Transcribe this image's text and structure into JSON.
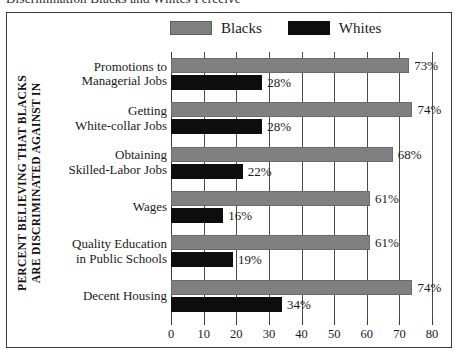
{
  "figure": {
    "top_caption": "Discrimination Blacks and Whites Perceive",
    "axis_title_line1": "PERCENT BELIEVING THAT BLACKS",
    "axis_title_line2": "ARE DISCRIMINATED AGAINST IN"
  },
  "legend": {
    "entries": [
      {
        "label": "Blacks",
        "color": "#808080",
        "swatch": "blacks"
      },
      {
        "label": "Whites",
        "color": "#0d0d0d",
        "swatch": "whites"
      }
    ]
  },
  "chart_data": {
    "type": "bar",
    "orientation": "horizontal",
    "grouped": true,
    "title": "Discrimination Blacks and Whites Perceive",
    "xlabel": "",
    "ylabel": "PERCENT BELIEVING THAT BLACKS ARE DISCRIMINATED AGAINST IN",
    "xlim": [
      0,
      80
    ],
    "xticks": [
      0,
      10,
      20,
      30,
      40,
      50,
      60,
      70,
      80
    ],
    "xticklabels": [
      "0",
      "10",
      "20",
      "30",
      "40",
      "50",
      "60",
      "70",
      "80"
    ],
    "grid": "vertical",
    "legend_position": "top-center",
    "categories": [
      "Promotions to Managerial Jobs",
      "Getting White-collar Jobs",
      "Obtaining Skilled-Labor Jobs",
      "Wages",
      "Quality Education in Public Schools",
      "Decent Housing"
    ],
    "category_lines": [
      [
        "Promotions to",
        "Managerial Jobs"
      ],
      [
        "Getting",
        "White-collar Jobs"
      ],
      [
        "Obtaining",
        "Skilled-Labor Jobs"
      ],
      [
        "Wages"
      ],
      [
        "Quality Education",
        "in Public Schools"
      ],
      [
        "Decent Housing"
      ]
    ],
    "series": [
      {
        "name": "Blacks",
        "color": "#808080",
        "values": [
          73,
          74,
          68,
          61,
          61,
          74
        ],
        "labels": [
          "73%",
          "74%",
          "68%",
          "61%",
          "61%",
          "74%"
        ]
      },
      {
        "name": "Whites",
        "color": "#0d0d0d",
        "values": [
          28,
          28,
          22,
          16,
          19,
          34
        ],
        "labels": [
          "28%",
          "28%",
          "22%",
          "16%",
          "19%",
          "34%"
        ]
      }
    ]
  }
}
